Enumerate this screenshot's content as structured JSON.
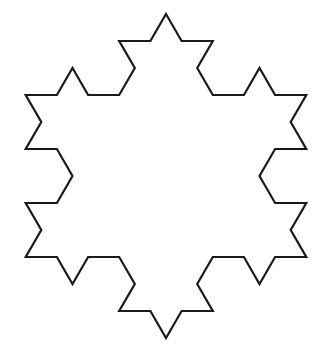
{
  "figure": {
    "type": "koch-snowflake",
    "iterations": 2,
    "center": [
      166,
      176
    ],
    "radius": 162,
    "stroke_color": "#1a1a1a",
    "stroke_width": 2.2,
    "fill_color": "#ffffff",
    "background": "#ffffff"
  }
}
